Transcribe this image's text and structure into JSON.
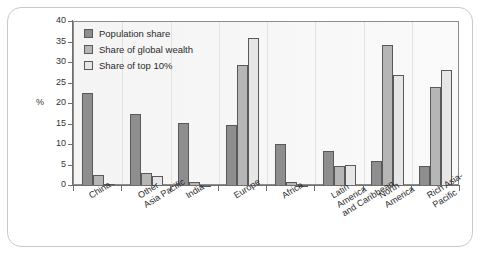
{
  "chart_data": {
    "type": "bar",
    "title": "",
    "xlabel": "",
    "ylabel": "%",
    "ylim": [
      0,
      40
    ],
    "yticks": [
      0,
      5,
      10,
      15,
      20,
      25,
      30,
      35,
      40
    ],
    "grid": false,
    "legend_position": "top-left",
    "categories": [
      "China",
      "Other\nAsia Pacific",
      "India",
      "Europe",
      "Africa",
      "Latin\nAmerica\nand Caribbean",
      "North\nAmerica",
      "Rich Asia-\nPacific"
    ],
    "series": [
      {
        "name": "Population share",
        "color": "#8e8e8e",
        "values": [
          22.8,
          17.5,
          15.4,
          15.0,
          10.2,
          8.5,
          6.0,
          5.0
        ]
      },
      {
        "name": "Share of global wealth",
        "color": "#b6b6b6",
        "values": [
          2.6,
          3.1,
          1.0,
          29.6,
          1.0,
          4.8,
          34.4,
          24.1
        ]
      },
      {
        "name": "Share of top 10%",
        "color": "#e6e6e6",
        "values": [
          0.4,
          2.4,
          0.3,
          36.1,
          0.3,
          5.2,
          27.1,
          28.2
        ]
      }
    ]
  },
  "legend": {
    "items": [
      {
        "label": "Population share",
        "swatch": "#8e8e8e"
      },
      {
        "label": "Share of global wealth",
        "swatch": "#b6b6b6"
      },
      {
        "label": "Share of top 10%",
        "swatch": "#e6e6e6"
      }
    ]
  },
  "axis": {
    "unit_label": "%"
  },
  "caption": {
    "text": ""
  }
}
